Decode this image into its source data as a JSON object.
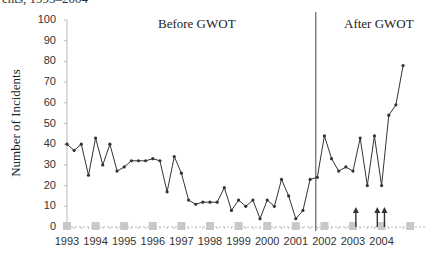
{
  "chart_data": {
    "type": "line",
    "title": "",
    "caption_fragment": "ents, 1993–2004",
    "xlabel": "",
    "ylabel": "Number of Incidents",
    "ylim": [
      0,
      100
    ],
    "yticks": [
      0,
      10,
      20,
      30,
      40,
      50,
      60,
      70,
      80,
      90,
      100
    ],
    "xticks": [
      "1993",
      "1994",
      "1995",
      "1996",
      "1997",
      "1998",
      "1999",
      "2000",
      "2001",
      "2002",
      "2003",
      "2004"
    ],
    "grid": false,
    "legend": null,
    "annotations": [
      {
        "text": "Before  GWOT",
        "region": "left of divider"
      },
      {
        "text": "After  GWOT",
        "region": "right of divider"
      },
      {
        "type": "vertical-line",
        "x": 2001.7,
        "label": "GWOT start"
      },
      {
        "type": "arrow-up",
        "x": 2003.1
      },
      {
        "type": "arrow-up",
        "x": 2003.85
      },
      {
        "type": "arrow-up",
        "x": 2004.1
      }
    ],
    "markers_on_baseline": {
      "description": "light gray square markers at y=0 at each year start",
      "x": [
        1993,
        1994,
        1995,
        1996,
        1997,
        1998,
        1999,
        2000,
        2001,
        2002,
        2003,
        2004,
        2005
      ]
    },
    "series": [
      {
        "name": "Incidents (quarterly)",
        "color": "#333333",
        "x": [
          1993.0,
          1993.25,
          1993.5,
          1993.75,
          1994.0,
          1994.25,
          1994.5,
          1994.75,
          1995.0,
          1995.25,
          1995.5,
          1995.75,
          1996.0,
          1996.25,
          1996.5,
          1996.75,
          1997.0,
          1997.25,
          1997.5,
          1997.75,
          1998.0,
          1998.25,
          1998.5,
          1998.75,
          1999.0,
          1999.25,
          1999.5,
          1999.75,
          2000.0,
          2000.25,
          2000.5,
          2000.75,
          2001.0,
          2001.25,
          2001.5,
          2001.75,
          2002.0,
          2002.25,
          2002.5,
          2002.75,
          2003.0,
          2003.25,
          2003.5,
          2003.75,
          2004.0,
          2004.25,
          2004.5,
          2004.75
        ],
        "values": [
          40,
          37,
          40,
          25,
          43,
          30,
          40,
          27,
          29,
          32,
          32,
          32,
          33,
          32,
          17,
          34,
          26,
          13,
          11,
          12,
          12,
          12,
          19,
          8,
          13,
          10,
          13,
          4,
          13,
          10,
          23,
          15,
          4,
          8,
          23,
          24,
          44,
          33,
          27,
          29,
          27,
          43,
          20,
          44,
          20,
          54,
          59,
          78
        ]
      }
    ]
  },
  "labels": {
    "caption": "ents, 1993–2004",
    "ylabel": "Number of Incidents",
    "before": "Before  GWOT",
    "after": "After  GWOT"
  },
  "colors": {
    "line": "#333333",
    "axis": "#bbbbbb",
    "divider": "#444444",
    "baseline_marker": "#c8c8c8",
    "arrow": "#333333"
  }
}
